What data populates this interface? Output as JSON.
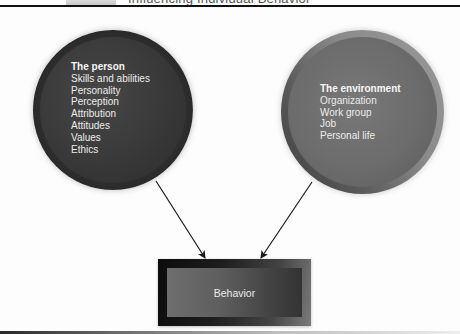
{
  "header": {
    "title": "Influencing Individual Behavior"
  },
  "diagram": {
    "person": {
      "heading": "The person",
      "items": [
        "Skills and abilities",
        "Personality",
        "Perception",
        "Attribution",
        "Attitudes",
        "Values",
        "Ethics"
      ]
    },
    "environment": {
      "heading": "The environment",
      "items": [
        "Organization",
        "Work group",
        "Job",
        "Personal life"
      ]
    },
    "outcome": {
      "label": "Behavior"
    },
    "connections": [
      {
        "from": "The person",
        "to": "Behavior"
      },
      {
        "from": "The environment",
        "to": "Behavior"
      }
    ]
  },
  "colors": {
    "person_fill": "#3a3a3a",
    "environment_fill": "#6e6e6e",
    "behavior_fill": "#555555",
    "text": "#ececec",
    "rule": "#111111"
  }
}
